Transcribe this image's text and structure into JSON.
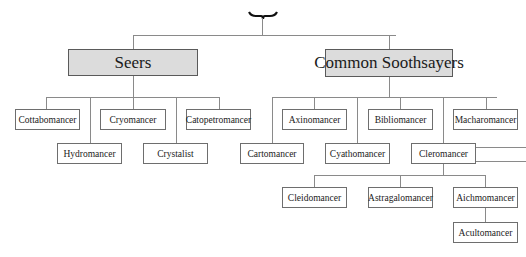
{
  "diagram": {
    "root": {
      "icon": "brace-icon"
    },
    "groups": [
      {
        "label": "Seers",
        "children": [
          "Cottabomancer",
          "Hydromancer",
          "Cryomancer",
          "Crystalist",
          "Catopetromancer"
        ]
      },
      {
        "label": "Common Soothsayers",
        "children": [
          "Cartomancer",
          "Axinomancer",
          "Cyathomancer",
          "Bibliomancer",
          "Cleromancer",
          "Macharomancer"
        ],
        "cleromancer_children": [
          "Cleidomancer",
          "Astragalomancer",
          "Aichmomancer"
        ],
        "aichmomancer_children": [
          "Acultomancer"
        ]
      }
    ]
  },
  "nodes": {
    "seers": "Seers",
    "common": "Common Soothsayers",
    "cottabomancer": "Cottabomancer",
    "cryomancer": "Cryomancer",
    "catopetromancer": "Catopetromancer",
    "hydromancer": "Hydromancer",
    "crystalist": "Crystalist",
    "axinomancer": "Axinomancer",
    "bibliomancer": "Bibliomancer",
    "macharomancer": "Macharomancer",
    "cartomancer": "Cartomancer",
    "cyathomancer": "Cyathomancer",
    "cleromancer": "Cleromancer",
    "cleidomancer": "Cleidomancer",
    "astragalomancer": "Astragalomancer",
    "aichmomancer": "Aichmomancer",
    "acultomancer": "Acultomancer"
  }
}
